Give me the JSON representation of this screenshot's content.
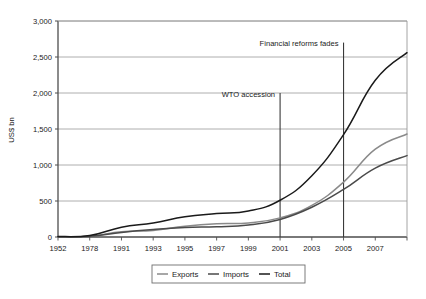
{
  "chart_data": {
    "type": "line",
    "title": "",
    "xlabel": "",
    "ylabel": "US$ bn",
    "ylim": [
      0,
      3000
    ],
    "yticks": [
      0,
      500,
      1000,
      1500,
      2000,
      2500,
      3000
    ],
    "ytick_labels": [
      "0",
      "500",
      "1,000",
      "1,500",
      "2,000",
      "2,500",
      "3,000"
    ],
    "grid": true,
    "legend_position": "bottom",
    "x": [
      1952,
      1978,
      1991,
      1993,
      1995,
      1997,
      1999,
      2001,
      2003,
      2005,
      2007,
      2008
    ],
    "xtick_labels": [
      "1952",
      "1978",
      "1991",
      "1993",
      "1995",
      "1997",
      "1999",
      "2001",
      "2003",
      "2005",
      "2007"
    ],
    "series": [
      {
        "name": "Exports",
        "color": "#8a8a8a",
        "values": [
          3,
          10,
          72,
          92,
          149,
          183,
          195,
          266,
          438,
          762,
          1220,
          1430
        ]
      },
      {
        "name": "Imports",
        "color": "#4a4a4a",
        "values": [
          3,
          11,
          64,
          104,
          132,
          142,
          166,
          244,
          413,
          660,
          956,
          1130
        ]
      },
      {
        "name": "Total",
        "color": "#1a1a1a",
        "values": [
          6,
          21,
          136,
          196,
          281,
          325,
          361,
          510,
          851,
          1422,
          2176,
          2560
        ]
      }
    ],
    "annotations": [
      {
        "label": "WTO accession",
        "x": 2001,
        "line_top_value": 2000
      },
      {
        "label": "Financial reforms fades",
        "x": 2005,
        "line_top_value": 2700
      }
    ]
  },
  "legend": {
    "items": [
      {
        "label": "Exports"
      },
      {
        "label": "Imports"
      },
      {
        "label": "Total"
      }
    ]
  },
  "colors": {
    "axis": "#4d4d4d",
    "grid": "#9a9a9a",
    "annotation_line": "#3a3a3a",
    "text": "#1a1a1a",
    "legend_border": "#6e6e6e",
    "background": "#ffffff"
  }
}
